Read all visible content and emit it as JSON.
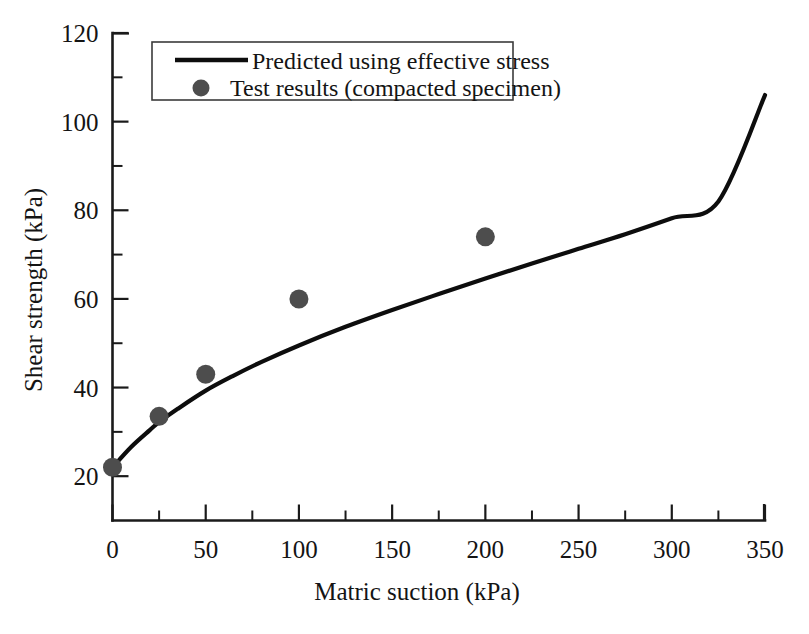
{
  "chart_data": {
    "type": "line",
    "title": "",
    "subtitle": "",
    "xlabel": "Matric suction (kPa)",
    "ylabel": "Shear strength (kPa)",
    "xlim": [
      0,
      350
    ],
    "ylim": [
      10,
      120
    ],
    "xticks": [
      0,
      50,
      100,
      150,
      200,
      250,
      300,
      350
    ],
    "xtick_labels": [
      "0",
      "50",
      "100",
      "150",
      "200",
      "250",
      "300",
      "350"
    ],
    "xminor_ticks": [
      25,
      75,
      125,
      175,
      225,
      275,
      325
    ],
    "yticks": [
      20,
      40,
      60,
      80,
      100,
      120
    ],
    "ytick_labels": [
      "20",
      "40",
      "60",
      "80",
      "100",
      "120"
    ],
    "yminor_ticks": [
      30,
      50,
      70,
      90,
      110
    ],
    "grid": false,
    "legend_position": "top-left",
    "series": [
      {
        "name": "Predicted  using effective stress",
        "type": "line",
        "marker": "none",
        "color": "#0d0d0d",
        "x": [
          0,
          10,
          20,
          25,
          35,
          50,
          65,
          80,
          100,
          125,
          150,
          175,
          200,
          225,
          250,
          275,
          300,
          325,
          350
        ],
        "y": [
          22.0,
          26.6,
          30.4,
          32.2,
          35.2,
          39.3,
          42.7,
          45.8,
          49.5,
          53.7,
          57.5,
          61.1,
          64.6,
          68.0,
          71.3,
          74.6,
          78.2,
          82.0,
          106.0
        ]
      },
      {
        "name": "Test results (compacted specimen)",
        "type": "scatter",
        "marker": "filled-circle",
        "color": "#4d4d4d",
        "x": [
          0,
          25,
          50,
          100,
          200
        ],
        "y": [
          22.0,
          33.5,
          43.0,
          60.0,
          74.0
        ]
      }
    ]
  },
  "legend": {
    "entries": [
      {
        "label": "Predicted  using effective stress",
        "marker": "line",
        "color": "#0d0d0d"
      },
      {
        "label": "Test results (compacted specimen)",
        "marker": "filled-circle",
        "color": "#4d4d4d"
      }
    ]
  },
  "colors": {
    "background": "#ffffff",
    "axis": "#1a1a1a",
    "curve": "#0d0d0d",
    "marker": "#4d4d4d",
    "text": "#141414",
    "legend_border": "#3b3b3b"
  }
}
